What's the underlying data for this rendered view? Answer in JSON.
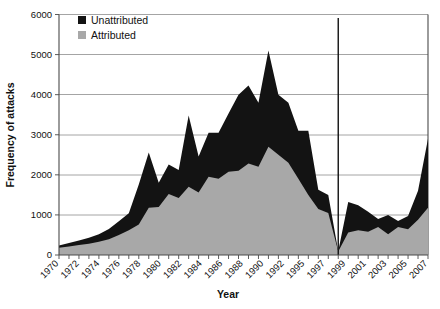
{
  "chart_data": {
    "type": "area",
    "title": "",
    "subtitle": "",
    "xlabel": "Year",
    "ylabel": "Frequency of attacks",
    "stacked": true,
    "grid": true,
    "grid_axis": "y",
    "legend_position": "top-left-inside",
    "xlim": [
      1970,
      2007
    ],
    "ylim": [
      0,
      6000
    ],
    "ytick_values": [
      0,
      1000,
      2000,
      3000,
      4000,
      5000,
      6000
    ],
    "ytick_labels": [
      "0",
      "1000",
      "2000",
      "3000",
      "4000",
      "5000",
      "6000"
    ],
    "xtick_labels": [
      "1970",
      "1972",
      "1974",
      "1976",
      "1978",
      "1980",
      "1982",
      "1984",
      "1986",
      "1988",
      "1990",
      "1992",
      "1995",
      "1997",
      "1999",
      "2001",
      "2003",
      "2005",
      "2007"
    ],
    "x": [
      1970,
      1971,
      1972,
      1973,
      1974,
      1975,
      1976,
      1977,
      1978,
      1979,
      1980,
      1981,
      1982,
      1983,
      1984,
      1985,
      1986,
      1987,
      1988,
      1989,
      1990,
      1991,
      1992,
      1993,
      1994,
      1995,
      1996,
      1997,
      1998,
      1999,
      2000,
      2001,
      2002,
      2003,
      2004,
      2005,
      2006,
      2007
    ],
    "series": [
      {
        "name": "Attributed",
        "color": "#a8a8a8",
        "values": [
          180,
          210,
          250,
          280,
          330,
          390,
          500,
          620,
          760,
          1180,
          1200,
          1520,
          1420,
          1700,
          1560,
          1950,
          1900,
          2080,
          2100,
          2280,
          2200,
          2700,
          2500,
          2300,
          1900,
          1500,
          1150,
          1050,
          90,
          560,
          620,
          580,
          700,
          520,
          700,
          640,
          880,
          1180
        ]
      },
      {
        "name": "Unattributed",
        "color": "#131313",
        "values": [
          60,
          90,
          110,
          150,
          190,
          260,
          340,
          420,
          1000,
          1380,
          600,
          740,
          700,
          1780,
          900,
          1100,
          1150,
          1450,
          1900,
          1950,
          1600,
          2400,
          1500,
          1500,
          1200,
          1600,
          480,
          450,
          5,
          760,
          620,
          500,
          200,
          480,
          150,
          330,
          720,
          1720
        ]
      }
    ],
    "totals": [
      240,
      300,
      360,
      430,
      520,
      650,
      840,
      1040,
      1760,
      2560,
      1800,
      2260,
      2120,
      3480,
      2460,
      3050,
      3050,
      3530,
      4000,
      4230,
      3800,
      5100,
      4000,
      3800,
      3100,
      3100,
      1630,
      1500,
      95,
      1320,
      1240,
      1080,
      900,
      1000,
      850,
      970,
      1600,
      2900
    ],
    "annotations": [
      {
        "type": "vertical-line",
        "x": 1998,
        "label": ""
      }
    ]
  },
  "legend": {
    "items": [
      {
        "label": "Unattributed",
        "swatch": "#131313"
      },
      {
        "label": "Attributed",
        "swatch": "#a8a8a8"
      }
    ]
  },
  "axes": {
    "y_title": "Frequency of attacks",
    "x_title": "Year"
  }
}
